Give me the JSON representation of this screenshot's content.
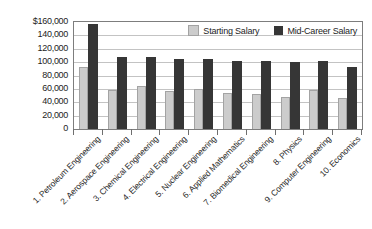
{
  "chart_data": {
    "type": "bar",
    "title": "",
    "xlabel": "",
    "ylabel": "",
    "categories": [
      "1. Petroleum Engineering",
      "2. Aerospace Engineering",
      "3. Chemical Engineering",
      "4. Electrical Engineering",
      "5. Nuclear Engineering",
      "6. Applied Mathematics",
      "7. Biomedical Engineering",
      "8. Physics",
      "9. Computer Engineering",
      "10. Economics"
    ],
    "series": [
      {
        "name": "Starting Salary",
        "color": "#cccccc",
        "values": [
          93000,
          58000,
          64000,
          57000,
          60000,
          54000,
          52000,
          48000,
          59000,
          46000
        ]
      },
      {
        "name": "Mid-Career Salary",
        "color": "#363636",
        "values": [
          157000,
          108000,
          108000,
          105000,
          104000,
          102000,
          101000,
          100000,
          101000,
          93000
        ]
      }
    ],
    "ylim": [
      0,
      160000
    ],
    "ytick_step": 20000,
    "ytick_labels": [
      "$160,000",
      "140,000",
      "120,000",
      "100,000",
      "80,000",
      "60,000",
      "40,000",
      "20,000",
      "0"
    ],
    "grid": true,
    "legend_position": "top-right-inside",
    "colors": {
      "grid": "#c3c3c3",
      "axis_border": "#7d7d7d",
      "text": "#1d1d1d"
    }
  }
}
